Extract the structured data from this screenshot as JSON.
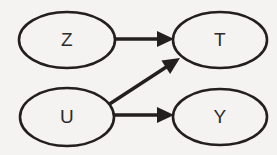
{
  "diagram": {
    "type": "directed-acyclic-graph",
    "background_color": "#f4f3f1",
    "stroke_color": "#231f1f",
    "label_color": "#2b2b2b",
    "stroke_width": 2.6,
    "nodes": [
      {
        "id": "Z",
        "label": "Z",
        "shape": "ellipse",
        "cx": 67,
        "cy": 40,
        "rx": 48,
        "ry": 28
      },
      {
        "id": "T",
        "label": "T",
        "shape": "ellipse",
        "cx": 220,
        "cy": 40,
        "rx": 47,
        "ry": 28
      },
      {
        "id": "U",
        "label": "U",
        "shape": "ellipse",
        "cx": 67,
        "cy": 117,
        "rx": 47,
        "ry": 29
      },
      {
        "id": "Y",
        "label": "Y",
        "shape": "ellipse",
        "cx": 220,
        "cy": 117,
        "rx": 47,
        "ry": 28
      }
    ],
    "edges": [
      {
        "id": "z-to-t",
        "from": "Z",
        "to": "T",
        "style": "solid-arrow",
        "x1": 114,
        "y1": 39,
        "x2": 174,
        "y2": 39
      },
      {
        "id": "u-to-t",
        "from": "U",
        "to": "T",
        "style": "solid-arrow",
        "x1": 108,
        "y1": 105,
        "x2": 180,
        "y2": 58
      },
      {
        "id": "u-to-y",
        "from": "U",
        "to": "Y",
        "style": "solid-arrow",
        "x1": 112,
        "y1": 115,
        "x2": 174,
        "y2": 115
      }
    ],
    "arrowhead": {
      "length": 17,
      "half_width": 8
    }
  }
}
